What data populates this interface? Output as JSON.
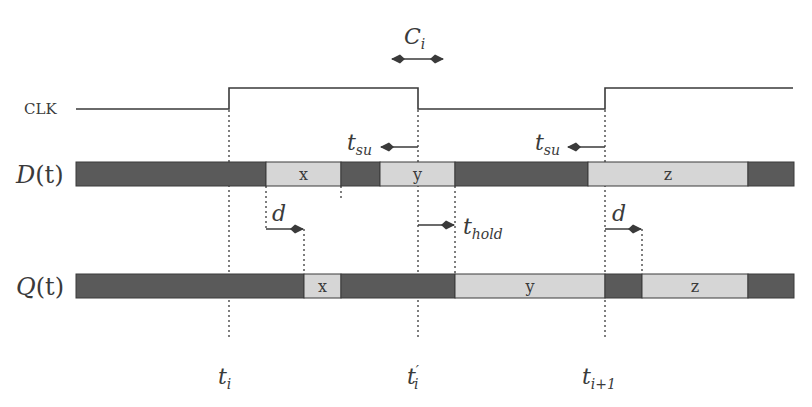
{
  "colors": {
    "line": "#3a3a3a",
    "dark_segment": "#5a5a5a",
    "light_segment": "#d6d6d6",
    "background": "#ffffff"
  },
  "signals": {
    "clk": {
      "label": "CLK",
      "low_y": 109,
      "high_y": 88,
      "points": [
        [
          76,
          109
        ],
        [
          229,
          109
        ],
        [
          229,
          88
        ],
        [
          418,
          88
        ],
        [
          418,
          109
        ],
        [
          605,
          109
        ],
        [
          605,
          88
        ],
        [
          793,
          88
        ]
      ]
    },
    "d": {
      "label_main": "D",
      "label_arg": "(t)",
      "y": 162,
      "height": 24,
      "segments": [
        {
          "x0": 76,
          "x1": 266,
          "kind": "dark",
          "text": ""
        },
        {
          "x0": 266,
          "x1": 341,
          "kind": "light",
          "text": "x"
        },
        {
          "x0": 341,
          "x1": 380,
          "kind": "dark",
          "text": ""
        },
        {
          "x0": 380,
          "x1": 455,
          "kind": "light",
          "text": "y"
        },
        {
          "x0": 455,
          "x1": 588,
          "kind": "dark",
          "text": ""
        },
        {
          "x0": 588,
          "x1": 748,
          "kind": "light",
          "text": "z"
        },
        {
          "x0": 748,
          "x1": 794,
          "kind": "dark",
          "text": ""
        }
      ]
    },
    "q": {
      "label_main": "Q",
      "label_arg": "(t)",
      "y": 274,
      "height": 24,
      "segments": [
        {
          "x0": 76,
          "x1": 304,
          "kind": "dark",
          "text": ""
        },
        {
          "x0": 304,
          "x1": 341,
          "kind": "light",
          "text": "x"
        },
        {
          "x0": 341,
          "x1": 455,
          "kind": "dark",
          "text": ""
        },
        {
          "x0": 455,
          "x1": 605,
          "kind": "light",
          "text": "y"
        },
        {
          "x0": 605,
          "x1": 642,
          "kind": "dark",
          "text": ""
        },
        {
          "x0": 642,
          "x1": 748,
          "kind": "light",
          "text": "z"
        },
        {
          "x0": 748,
          "x1": 794,
          "kind": "dark",
          "text": ""
        }
      ]
    }
  },
  "annotations": {
    "c_i": {
      "main": "C",
      "sub": "i",
      "x0": 380,
      "x1": 455,
      "y": 59
    },
    "tsu_1": {
      "main": "t",
      "sub": "su",
      "from": 418,
      "to": 380,
      "y": 147
    },
    "tsu_2": {
      "main": "t",
      "sub": "su",
      "from": 605,
      "to": 567,
      "y": 147
    },
    "d_1": {
      "main": "d",
      "from": 266,
      "to": 304,
      "y": 229
    },
    "thold": {
      "main": "t",
      "sub": "hold",
      "from": 418,
      "to": 455,
      "y": 225
    },
    "d_2": {
      "main": "d",
      "from": 605,
      "to": 642,
      "y": 229
    }
  },
  "time_markers": [
    {
      "main": "t",
      "sub": "i",
      "prime": "",
      "x": 229
    },
    {
      "main": "t",
      "sub": "i",
      "prime": "′",
      "x": 418
    },
    {
      "main": "t",
      "sub": "i+1",
      "prime": "",
      "x": 605
    }
  ],
  "guide_lines": [
    {
      "x": 229,
      "y0": 110,
      "y1": 340
    },
    {
      "x": 418,
      "y0": 110,
      "y1": 340
    },
    {
      "x": 605,
      "y0": 110,
      "y1": 340
    },
    {
      "x": 266,
      "y0": 186,
      "y1": 229
    },
    {
      "x": 304,
      "y0": 229,
      "y1": 274
    },
    {
      "x": 341,
      "y0": 186,
      "y1": 200
    },
    {
      "x": 455,
      "y0": 186,
      "y1": 274
    },
    {
      "x": 642,
      "y0": 229,
      "y1": 274
    }
  ]
}
